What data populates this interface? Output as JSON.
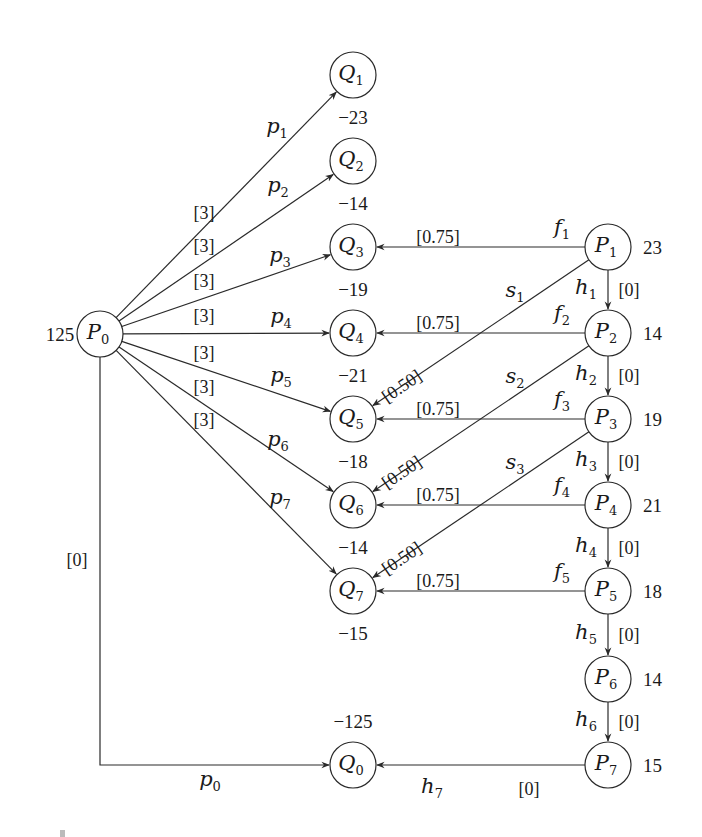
{
  "diagram": {
    "type": "flow network",
    "node_radius": 23,
    "colors": {
      "stroke": "#2a2a2a",
      "text": "#1a1a1a",
      "background": "#ffffff"
    },
    "source": {
      "id": "P0",
      "label": "P",
      "sub": "0",
      "supply": "125",
      "x": 100,
      "y": 334
    },
    "sink": {
      "id": "Q0",
      "label": "Q",
      "sub": "0",
      "demand": "−125",
      "x": 353,
      "y": 765
    },
    "q_nodes": [
      {
        "id": "Q1",
        "label": "Q",
        "sub": "1",
        "demand": "−23",
        "x": 353,
        "y": 75
      },
      {
        "id": "Q2",
        "label": "Q",
        "sub": "2",
        "demand": "−14",
        "x": 353,
        "y": 161
      },
      {
        "id": "Q3",
        "label": "Q",
        "sub": "3",
        "demand": "−19",
        "x": 353,
        "y": 247
      },
      {
        "id": "Q4",
        "label": "Q",
        "sub": "4",
        "demand": "−21",
        "x": 353,
        "y": 333
      },
      {
        "id": "Q5",
        "label": "Q",
        "sub": "5",
        "demand": "−18",
        "x": 353,
        "y": 419
      },
      {
        "id": "Q6",
        "label": "Q",
        "sub": "6",
        "demand": "−14",
        "x": 353,
        "y": 505
      },
      {
        "id": "Q7",
        "label": "Q",
        "sub": "7",
        "demand": "−15",
        "x": 353,
        "y": 591
      }
    ],
    "p_nodes": [
      {
        "id": "P1",
        "label": "P",
        "sub": "1",
        "supply": "23",
        "x": 608,
        "y": 247
      },
      {
        "id": "P2",
        "label": "P",
        "sub": "2",
        "supply": "14",
        "x": 608,
        "y": 333
      },
      {
        "id": "P3",
        "label": "P",
        "sub": "3",
        "supply": "19",
        "x": 608,
        "y": 419
      },
      {
        "id": "P4",
        "label": "P",
        "sub": "4",
        "supply": "21",
        "x": 608,
        "y": 505
      },
      {
        "id": "P5",
        "label": "P",
        "sub": "5",
        "supply": "18",
        "x": 608,
        "y": 591
      },
      {
        "id": "P6",
        "label": "P",
        "sub": "6",
        "supply": "14",
        "x": 608,
        "y": 679
      },
      {
        "id": "P7",
        "label": "P",
        "sub": "7",
        "supply": "15",
        "x": 608,
        "y": 765
      }
    ],
    "p_edges": [
      {
        "from": "P0",
        "to": "Q1",
        "name": "p",
        "sub": "1",
        "cost": "[3]"
      },
      {
        "from": "P0",
        "to": "Q2",
        "name": "p",
        "sub": "2",
        "cost": "[3]"
      },
      {
        "from": "P0",
        "to": "Q3",
        "name": "p",
        "sub": "3",
        "cost": "[3]"
      },
      {
        "from": "P0",
        "to": "Q4",
        "name": "p",
        "sub": "4",
        "cost": "[3]"
      },
      {
        "from": "P0",
        "to": "Q5",
        "name": "p",
        "sub": "5",
        "cost": "[3]"
      },
      {
        "from": "P0",
        "to": "Q6",
        "name": "p",
        "sub": "6",
        "cost": "[3]"
      },
      {
        "from": "P0",
        "to": "Q7",
        "name": "p",
        "sub": "7",
        "cost": "[3]"
      }
    ],
    "p0_edge": {
      "from": "P0",
      "to": "Q0",
      "name": "p",
      "sub": "0",
      "cost": "[0]"
    },
    "f_edges": [
      {
        "from": "P1",
        "to": "Q3",
        "name": "f",
        "sub": "1",
        "cost": "[0.75]"
      },
      {
        "from": "P2",
        "to": "Q4",
        "name": "f",
        "sub": "2",
        "cost": "[0.75]"
      },
      {
        "from": "P3",
        "to": "Q5",
        "name": "f",
        "sub": "3",
        "cost": "[0.75]"
      },
      {
        "from": "P4",
        "to": "Q6",
        "name": "f",
        "sub": "4",
        "cost": "[0.75]"
      },
      {
        "from": "P5",
        "to": "Q7",
        "name": "f",
        "sub": "5",
        "cost": "[0.75]"
      }
    ],
    "s_edges": [
      {
        "from": "P1",
        "to": "Q5",
        "name": "s",
        "sub": "1",
        "cost": "[0.50]"
      },
      {
        "from": "P2",
        "to": "Q6",
        "name": "s",
        "sub": "2",
        "cost": "[0.50]"
      },
      {
        "from": "P3",
        "to": "Q7",
        "name": "s",
        "sub": "3",
        "cost": "[0.50]"
      }
    ],
    "h_edges": [
      {
        "from": "P1",
        "to": "P2",
        "name": "h",
        "sub": "1",
        "cost": "[0]"
      },
      {
        "from": "P2",
        "to": "P3",
        "name": "h",
        "sub": "2",
        "cost": "[0]"
      },
      {
        "from": "P3",
        "to": "P4",
        "name": "h",
        "sub": "3",
        "cost": "[0]"
      },
      {
        "from": "P4",
        "to": "P5",
        "name": "h",
        "sub": "4",
        "cost": "[0]"
      },
      {
        "from": "P5",
        "to": "P6",
        "name": "h",
        "sub": "5",
        "cost": "[0]"
      },
      {
        "from": "P6",
        "to": "P7",
        "name": "h",
        "sub": "6",
        "cost": "[0]"
      },
      {
        "from": "P7",
        "to": "Q0",
        "name": "h",
        "sub": "7",
        "cost": "[0]"
      }
    ]
  }
}
